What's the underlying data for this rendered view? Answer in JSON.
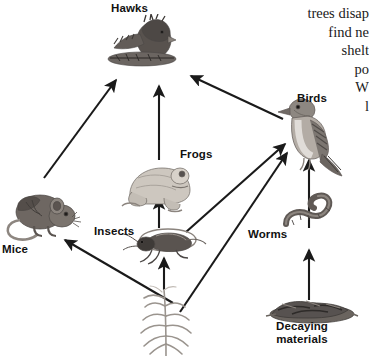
{
  "diagram": {
    "title_label": "Hawks",
    "type": "food-web",
    "background_color": "#ffffff",
    "arrow_color": "#1a1a1a",
    "label_color": "#111111",
    "organisms": [
      {
        "id": "hawks",
        "label": "Hawks",
        "label_x": 111,
        "label_y": 2,
        "icon": "hawk-icon"
      },
      {
        "id": "mice",
        "label": "Mice",
        "label_x": 2,
        "label_y": 243,
        "icon": "mouse-icon"
      },
      {
        "id": "frogs",
        "label": "Frogs",
        "label_x": 180,
        "label_y": 148,
        "icon": "frog-icon"
      },
      {
        "id": "insects",
        "label": "Insects",
        "label_x": 94,
        "label_y": 225,
        "icon": "cricket-icon"
      },
      {
        "id": "birds",
        "label": "Birds",
        "label_x": 297,
        "label_y": 92,
        "icon": "bird-icon"
      },
      {
        "id": "worms",
        "label": "Worms",
        "label_x": 248,
        "label_y": 228,
        "icon": "worm-icon"
      },
      {
        "id": "decaying",
        "label": "Decaying\nmaterials",
        "label_x": 276,
        "label_y": 320,
        "icon": "decaying-materials-icon"
      },
      {
        "id": "plant",
        "label": "",
        "label_x": 0,
        "label_y": 0,
        "icon": "grass-plant-icon"
      }
    ],
    "arrows": [
      {
        "from": "mice",
        "to": "hawks"
      },
      {
        "from": "frogs",
        "to": "hawks"
      },
      {
        "from": "birds",
        "to": "hawks"
      },
      {
        "from": "insects",
        "to": "frogs"
      },
      {
        "from": "plant",
        "to": "insects"
      },
      {
        "from": "plant",
        "to": "mice"
      },
      {
        "from": "plant",
        "to": "birds"
      },
      {
        "from": "insects",
        "to": "birds"
      },
      {
        "from": "worms",
        "to": "birds"
      },
      {
        "from": "decaying",
        "to": "worms"
      }
    ]
  },
  "body_text": {
    "lines": [
      "trees disap",
      "find ne",
      "shelt",
      "po",
      "W",
      "l"
    ]
  }
}
